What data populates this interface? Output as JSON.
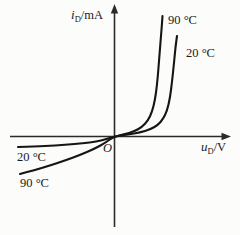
{
  "figure": {
    "background": "#fcfcfa",
    "ink": "#1a1a1a",
    "origin_label": "O"
  },
  "chart_data": {
    "type": "line",
    "xlabel": {
      "var": "u",
      "sub": "D",
      "rest": "/V",
      "display": "uD/V"
    },
    "ylabel": {
      "var": "i",
      "sub": "D",
      "rest": "/mA",
      "display": "iD/mA"
    },
    "axes": {
      "numeric_ticks": false,
      "origin_px": [
        114,
        136.5
      ],
      "x_axis_px": {
        "x1": 10,
        "x2": 231,
        "y": 136.5
      },
      "y_axis_px": {
        "y1": 4,
        "y2": 227,
        "x": 114.5
      }
    },
    "series": [
      {
        "name": "90 °C",
        "description": "higher temperature: forward knee at lower voltage, larger reverse current",
        "points_px": [
          [
            20,
            174
          ],
          [
            35,
            170
          ],
          [
            50,
            165.5
          ],
          [
            65,
            160.5
          ],
          [
            80,
            155
          ],
          [
            95,
            148.5
          ],
          [
            105,
            143
          ],
          [
            114,
            136.5
          ],
          [
            124,
            134.5
          ],
          [
            134,
            131.5
          ],
          [
            142,
            127
          ],
          [
            148,
            120.5
          ],
          [
            152,
            112
          ],
          [
            155,
            100
          ],
          [
            157,
            85
          ],
          [
            158.5,
            68
          ],
          [
            160,
            48
          ],
          [
            161.5,
            30
          ],
          [
            162.5,
            16
          ]
        ]
      },
      {
        "name": "20 °C",
        "description": "lower temperature: forward knee at higher voltage, small flat reverse current",
        "points_px": [
          [
            18,
            147
          ],
          [
            35,
            146.5
          ],
          [
            55,
            145.5
          ],
          [
            75,
            144
          ],
          [
            90,
            142.5
          ],
          [
            102,
            140.5
          ],
          [
            114,
            136.5
          ],
          [
            128,
            134.5
          ],
          [
            140,
            132.5
          ],
          [
            150,
            129.5
          ],
          [
            158,
            125
          ],
          [
            163,
            119
          ],
          [
            167,
            111
          ],
          [
            170,
            98
          ],
          [
            172,
            82
          ],
          [
            174,
            63
          ],
          [
            175.5,
            47
          ],
          [
            177,
            36
          ]
        ]
      }
    ],
    "annotations": [
      {
        "text": "90 °C",
        "region": "forward",
        "x": 168,
        "y": 24
      },
      {
        "text": "20 °C",
        "region": "forward",
        "x": 186,
        "y": 57
      },
      {
        "text": "20 °C",
        "region": "reverse",
        "x": 17,
        "y": 161
      },
      {
        "text": "90 °C",
        "region": "reverse",
        "x": 20,
        "y": 187
      }
    ],
    "legend": {
      "position": "none"
    },
    "grid": false
  }
}
